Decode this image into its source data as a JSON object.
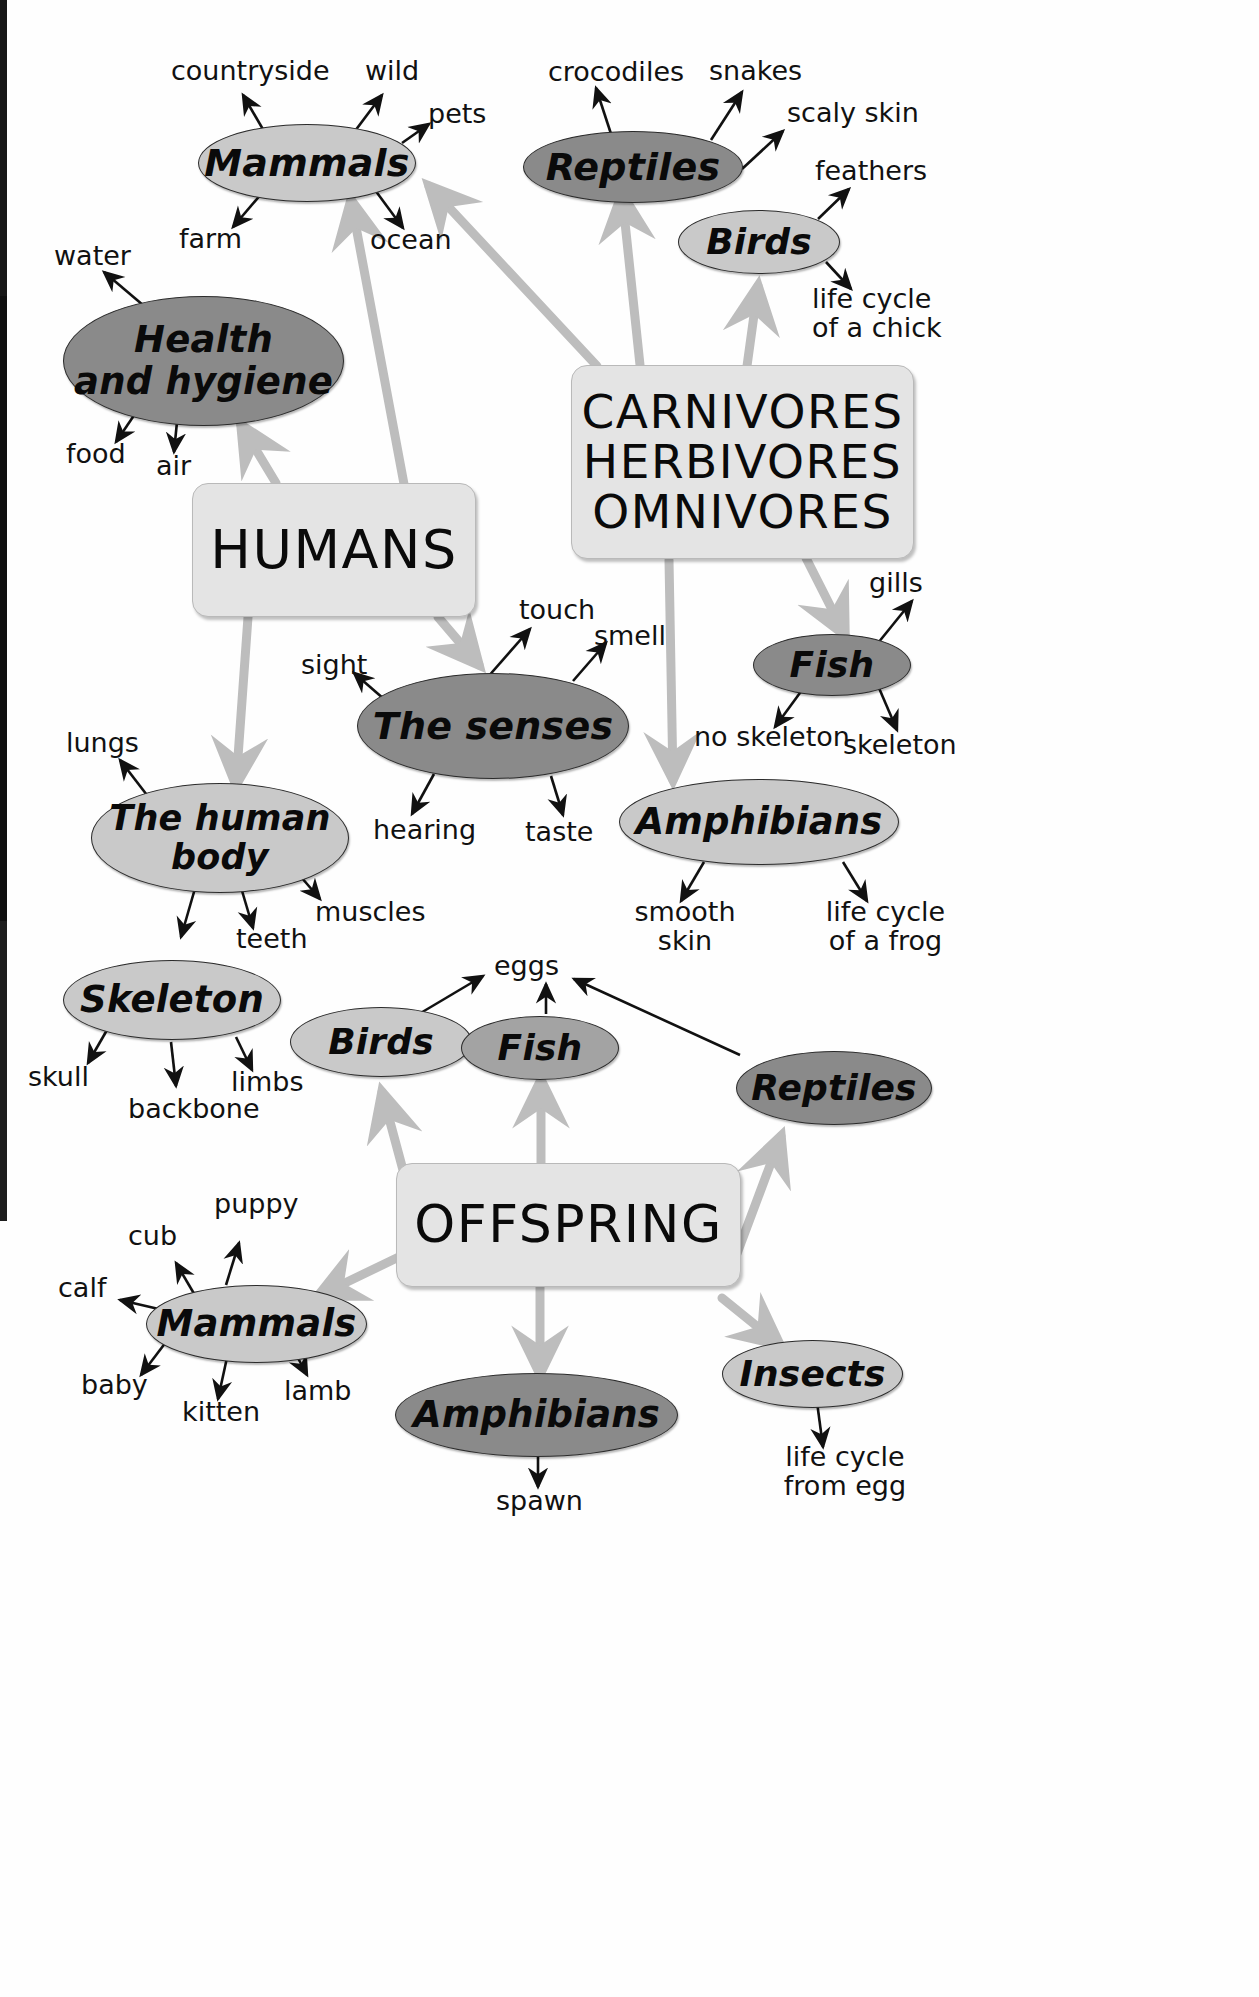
{
  "palette": {
    "oval_light": "#c9c9c9",
    "oval_mid": "#a3a3a3",
    "oval_dark": "#8a8a8a",
    "box_fill": "#e4e4e4",
    "thin_arrow": "#111111",
    "thick_arrow": "#bdbdbd",
    "text": "#0a0a0a",
    "page_edge": "#171717"
  },
  "hubs": {
    "humans": "HUMANS",
    "diets": "CARNIVORES\nHERBIVORES\nOMNIVORES",
    "diets_line1": "CARNIVORES",
    "diets_line2": "HERBIVORES",
    "diets_line3": "OMNIVORES",
    "offspring": "OFFSPRING"
  },
  "nodes": {
    "mammals_top": "Mammals",
    "health": "Health\nand hygiene",
    "health_line1": "Health",
    "health_line2": "and hygiene",
    "reptiles_top": "Reptiles",
    "birds_top": "Birds",
    "fish_top": "Fish",
    "senses": "The senses",
    "human_body": "The human\nbody",
    "human_body_line1": "The human",
    "human_body_line2": "body",
    "amphibians_top": "Amphibians",
    "skeleton": "Skeleton",
    "birds_bottom": "Birds",
    "fish_bottom": "Fish",
    "reptiles_bottom": "Reptiles",
    "mammals_bottom": "Mammals",
    "amphibians_bottom": "Amphibians",
    "insects_bottom": "Insects"
  },
  "leaves": {
    "countryside": "countryside",
    "wild": "wild",
    "pets": "pets",
    "farm": "farm",
    "ocean": "ocean",
    "water": "water",
    "food": "food",
    "air": "air",
    "crocodiles": "crocodiles",
    "snakes": "snakes",
    "scaly_skin": "scaly skin",
    "feathers": "feathers",
    "life_cycle_chick": "life cycle\nof a chick",
    "life_cycle_chick_l1": "life cycle",
    "life_cycle_chick_l2": "of a chick",
    "gills": "gills",
    "no_skeleton": "no skeleton",
    "skeleton_leaf": "skeleton",
    "sight": "sight",
    "touch": "touch",
    "smell": "smell",
    "hearing": "hearing",
    "taste": "taste",
    "lungs": "lungs",
    "muscles": "muscles",
    "teeth": "teeth",
    "smooth_skin": "smooth\nskin",
    "smooth_skin_l1": "smooth",
    "smooth_skin_l2": "skin",
    "life_cycle_frog": "life cycle\nof a frog",
    "life_cycle_frog_l1": "life cycle",
    "life_cycle_frog_l2": "of a frog",
    "skull": "skull",
    "backbone": "backbone",
    "limbs": "limbs",
    "eggs": "eggs",
    "puppy": "puppy",
    "cub": "cub",
    "calf": "calf",
    "baby": "baby",
    "kitten": "kitten",
    "lamb": "lamb",
    "spawn": "spawn",
    "life_cycle_egg": "life cycle\nfrom egg",
    "life_cycle_egg_l1": "life cycle",
    "life_cycle_egg_l2": "from egg"
  }
}
